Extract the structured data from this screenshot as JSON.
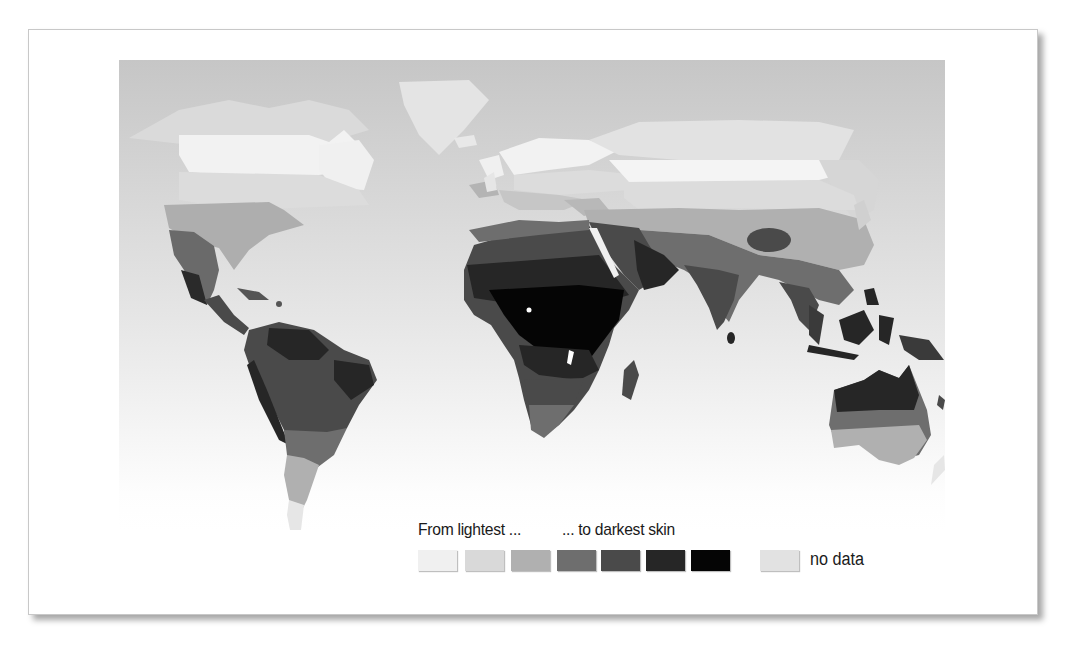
{
  "figure": {
    "legend": {
      "from_label": "From lightest ...",
      "to_label": "... to darkest skin",
      "scale": [
        {
          "level": 1,
          "color": "#f0f0f0"
        },
        {
          "level": 2,
          "color": "#d9d9d9"
        },
        {
          "level": 3,
          "color": "#b0b0b0"
        },
        {
          "level": 4,
          "color": "#6e6e6e"
        },
        {
          "level": 5,
          "color": "#4a4a4a"
        },
        {
          "level": 6,
          "color": "#262626"
        },
        {
          "level": 7,
          "color": "#050505"
        }
      ],
      "no_data": {
        "label": "no data",
        "color": "#e2e2e2"
      }
    },
    "colors": {
      "ocean_top": "#c4c4c4",
      "ocean_bottom": "#ffffff",
      "frame_border": "#c8c8c8"
    }
  }
}
